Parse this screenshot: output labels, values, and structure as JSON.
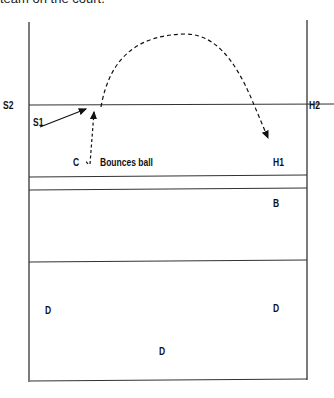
{
  "caption": "team on the court.",
  "labels": {
    "s2": "S2",
    "s1": "S1",
    "h2": "H2",
    "c": "C",
    "bounces": "Bounces ball",
    "h1": "H1",
    "b": "B",
    "d_left": "D",
    "d_right": "D",
    "d_center": "D"
  },
  "colors": {
    "line": "#333333",
    "text": "#111111"
  }
}
